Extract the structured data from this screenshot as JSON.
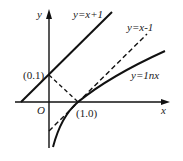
{
  "diagram": {
    "axes": {
      "x_label": "x",
      "y_label": "y",
      "origin_label": "O"
    },
    "curves": [
      {
        "label": "y=x+1",
        "style": "solid"
      },
      {
        "label": "y=x-1",
        "style": "dashed"
      },
      {
        "label": "y=1nx",
        "style": "solid"
      }
    ],
    "points": [
      {
        "label": "(0.1)"
      },
      {
        "label": "(1.0)"
      }
    ]
  }
}
